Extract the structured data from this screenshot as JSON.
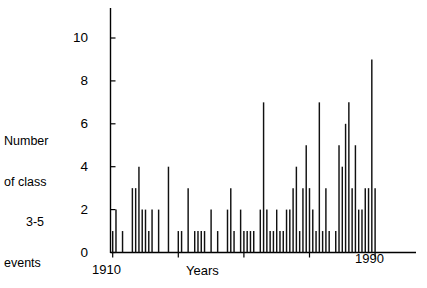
{
  "chart_data": {
    "type": "bar",
    "title": "",
    "xlabel": "Years",
    "ylabel": "Number of class 3-5 events",
    "ylabel_lines": [
      "Number",
      "of class",
      "3-5",
      "events"
    ],
    "xlim": [
      1909,
      1995
    ],
    "ylim": [
      0,
      10.6
    ],
    "grid": false,
    "legend": null,
    "y_ticks": [
      0,
      2,
      4,
      6,
      8,
      10
    ],
    "y_tick_labels": [
      "0",
      "2",
      "4",
      "6",
      "8",
      "10"
    ],
    "x_ticks": [
      1910,
      1930,
      1950,
      1970,
      1990
    ],
    "x_tick_labels_shown": [
      "1910",
      "1990"
    ],
    "x_axis_start_label": "1910",
    "x_axis_end_label": "1990",
    "categories": [
      1910,
      1911,
      1912,
      1913,
      1914,
      1915,
      1916,
      1917,
      1918,
      1919,
      1920,
      1921,
      1922,
      1923,
      1924,
      1925,
      1926,
      1927,
      1928,
      1929,
      1930,
      1931,
      1932,
      1933,
      1934,
      1935,
      1936,
      1937,
      1938,
      1939,
      1940,
      1941,
      1942,
      1943,
      1944,
      1945,
      1946,
      1947,
      1948,
      1949,
      1950,
      1951,
      1952,
      1953,
      1954,
      1955,
      1956,
      1957,
      1958,
      1959,
      1960,
      1961,
      1962,
      1963,
      1964,
      1965,
      1966,
      1967,
      1968,
      1969,
      1970,
      1971,
      1972,
      1973,
      1974,
      1975,
      1976,
      1977,
      1978,
      1979,
      1980,
      1981,
      1982,
      1983,
      1984,
      1985,
      1986,
      1987,
      1988,
      1989,
      1990
    ],
    "values": [
      1,
      2,
      0,
      1,
      0,
      0,
      3,
      3,
      4,
      2,
      2,
      1,
      2,
      0,
      2,
      0,
      0,
      4,
      0,
      0,
      1,
      1,
      0,
      3,
      0,
      1,
      1,
      1,
      1,
      0,
      2,
      0,
      1,
      0,
      0,
      2,
      3,
      1,
      0,
      2,
      1,
      1,
      1,
      1,
      0,
      2,
      7,
      2,
      1,
      1,
      2,
      1,
      1,
      2,
      2,
      3,
      4,
      1,
      3,
      5,
      3,
      2,
      1,
      7,
      1,
      3,
      1,
      0,
      1,
      5,
      4,
      6,
      7,
      3,
      5,
      2,
      2,
      3,
      3,
      9,
      3
    ],
    "values_note": "Bar heights estimated from pixel positions against the 0-10 y-axis."
  },
  "axes": {
    "y_axis_name": "vertical-axis",
    "x_axis_name": "horizontal-axis"
  }
}
